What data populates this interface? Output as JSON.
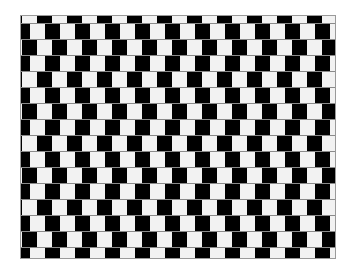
{
  "figure": {
    "title": "Café wall illusion",
    "colors": {
      "background": "#ffffff",
      "dark_tile": "#000000",
      "light_tile": "#f2f2f2",
      "mortar": "#8a8a8a"
    },
    "frame": {
      "left": 21,
      "top": 16,
      "width": 314,
      "height": 242
    },
    "tile_width": 15,
    "tile_period": 30,
    "row_pitch": 16,
    "mortar_thickness": 1,
    "rows": [
      {
        "top": 0,
        "height": 7,
        "white_start": 1
      },
      {
        "top": 8,
        "height": 15,
        "white_start": 9
      },
      {
        "top": 24,
        "height": 15,
        "white_start": 16
      },
      {
        "top": 40,
        "height": 15,
        "white_start": 9
      },
      {
        "top": 56,
        "height": 15,
        "white_start": 1
      },
      {
        "top": 72,
        "height": 15,
        "white_start": 9
      },
      {
        "top": 88,
        "height": 15,
        "white_start": 16
      },
      {
        "top": 104,
        "height": 15,
        "white_start": 9
      },
      {
        "top": 120,
        "height": 15,
        "white_start": 1
      },
      {
        "top": 136,
        "height": 15,
        "white_start": 9
      },
      {
        "top": 152,
        "height": 15,
        "white_start": 16
      },
      {
        "top": 168,
        "height": 15,
        "white_start": 9
      },
      {
        "top": 184,
        "height": 15,
        "white_start": 1
      },
      {
        "top": 200,
        "height": 15,
        "white_start": 9
      },
      {
        "top": 216,
        "height": 15,
        "white_start": 16
      },
      {
        "top": 232,
        "height": 10,
        "white_start": 9
      }
    ]
  }
}
